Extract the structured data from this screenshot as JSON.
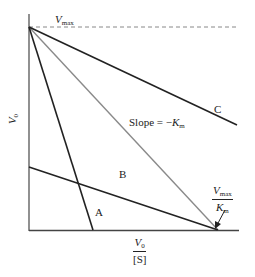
{
  "diagram": {
    "type": "Eadie-Hofstee plot",
    "y_axis_label": {
      "main": "V",
      "sub": "0"
    },
    "x_axis_label": {
      "numerator_main": "V",
      "numerator_sub": "0",
      "denominator": "[S]"
    },
    "vmax_label": {
      "main": "V",
      "sub": "max"
    },
    "intercept_label": {
      "numerator_main": "V",
      "numerator_sub": "max",
      "denominator_main": "K",
      "denominator_sub": "m"
    },
    "slope_label": {
      "prefix": "Slope = −",
      "main": "K",
      "sub": "m"
    },
    "lines": [
      {
        "name": "A",
        "label": "A"
      },
      {
        "name": "B",
        "label": "B"
      },
      {
        "name": "C",
        "label": "C"
      }
    ],
    "colors": {
      "axis": "#555555",
      "line": "#222222",
      "reference_line": "#8a8a8a",
      "dashed": "#888888"
    }
  }
}
